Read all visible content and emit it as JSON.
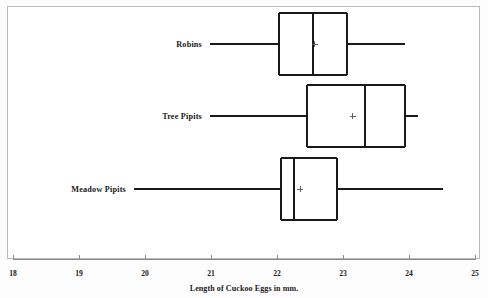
{
  "chart_data": {
    "type": "box",
    "title": "",
    "xlabel": "Length of Cuckoo Eggs in mm.",
    "ylabel": "",
    "xlim": [
      18,
      25
    ],
    "xticks": [
      18,
      19,
      20,
      21,
      22,
      23,
      24,
      25
    ],
    "xticklabels": [
      "18",
      "19",
      "20",
      "21",
      "22",
      "23",
      "24",
      "25"
    ],
    "grid": false,
    "orientation": "horizontal",
    "categories": [
      "Robins",
      "Tree Pipits",
      "Meadow Pipits"
    ],
    "boxes": [
      {
        "label": "Robins",
        "whisker_low": 21.1,
        "q1": 22.03,
        "median": 22.55,
        "q3": 23.06,
        "whisker_high": 23.94,
        "mean": 22.57,
        "mean_marker": "+"
      },
      {
        "label": "Tree Pipits",
        "whisker_low": 21.82,
        "q1": 22.45,
        "median": 23.33,
        "q3": 23.94,
        "whisker_high": 24.14,
        "mean": 23.15,
        "mean_marker": "+"
      },
      {
        "label": "Meadow Pipits",
        "whisker_low": 21.1,
        "q1": 22.06,
        "median": 22.26,
        "q3": 22.91,
        "whisker_high": 24.52,
        "mean": 22.35,
        "mean_marker": "+"
      }
    ]
  },
  "axis": {
    "x_title": "Length of Cuckoo Eggs in mm.",
    "tick_18": "18",
    "tick_19": "19",
    "tick_20": "20",
    "tick_21": "21",
    "tick_22": "22",
    "tick_23": "23",
    "tick_24": "24",
    "tick_25": "25"
  },
  "labels": {
    "robins": "Robins",
    "tree_pipits": "Tree Pipits",
    "meadow_pipits": "Meadow Pipits"
  },
  "colors": {
    "line": "#1a1a1a",
    "frame": "#b9b9b9",
    "axis": "#8a8a8a",
    "background": "#ffffff",
    "text": "#1a1a1a"
  }
}
